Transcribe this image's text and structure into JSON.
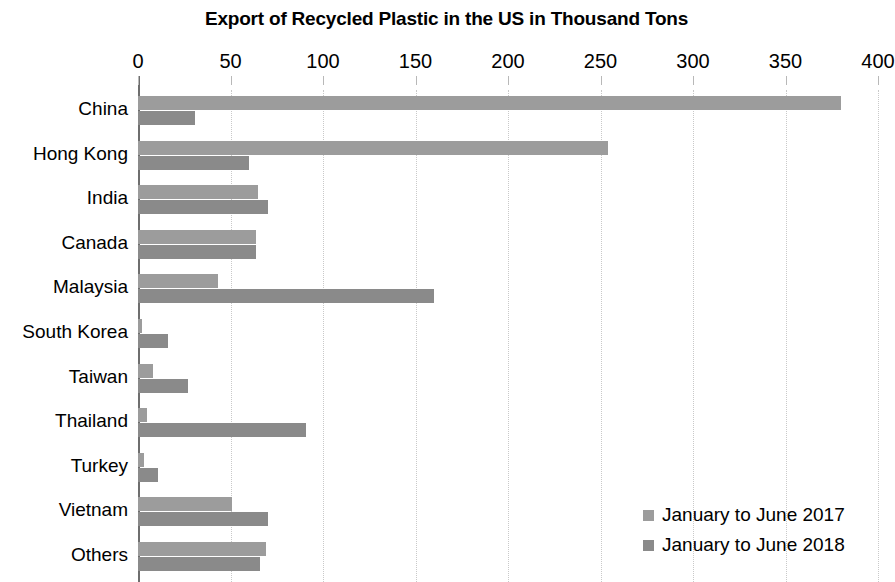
{
  "chart_data": {
    "type": "bar",
    "orientation": "horizontal",
    "title": "Export of Recycled Plastic in the US in Thousand Tons",
    "xlabel": "",
    "ylabel": "",
    "xlim": [
      0,
      400
    ],
    "x_ticks": [
      0,
      50,
      100,
      150,
      200,
      250,
      300,
      350,
      400
    ],
    "x_tick_labels": [
      "0",
      "50",
      "100",
      "150",
      "200",
      "250",
      "300",
      "350",
      "400"
    ],
    "grid": true,
    "grid_axis": "x",
    "legend_position": "bottom-right",
    "categories": [
      "China",
      "Hong Kong",
      "India",
      "Canada",
      "Malaysia",
      "South Korea",
      "Taiwan",
      "Thailand",
      "Turkey",
      "Vietnam",
      "Others"
    ],
    "series": [
      {
        "name": "January to June 2017",
        "color": "#9c9c9c",
        "values": [
          380,
          254,
          65,
          64,
          43,
          2,
          8,
          5,
          3,
          51,
          69
        ]
      },
      {
        "name": "January to June 2018",
        "color": "#8a8a8a",
        "values": [
          31,
          60,
          70,
          64,
          160,
          16,
          27,
          91,
          11,
          70,
          66
        ]
      }
    ]
  },
  "legend": {
    "items": [
      {
        "label": "January to June 2017",
        "color": "#9c9c9c"
      },
      {
        "label": "January to June 2018",
        "color": "#8a8a8a"
      }
    ]
  }
}
